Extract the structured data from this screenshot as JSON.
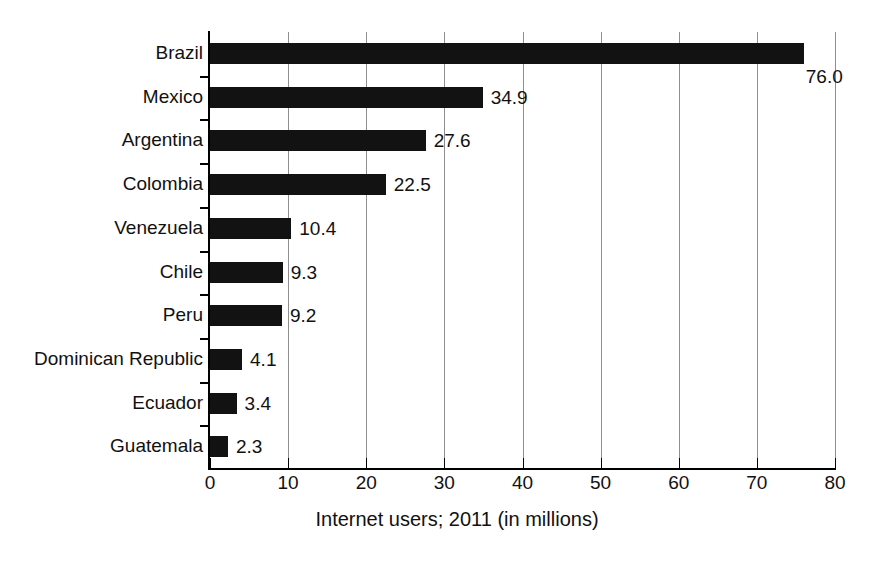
{
  "chart_data": {
    "type": "bar",
    "orientation": "horizontal",
    "title": "",
    "xlabel": "Internet users; 2011 (in millions)",
    "ylabel": "",
    "xlim": [
      0,
      80
    ],
    "xticks": [
      0,
      10,
      20,
      30,
      40,
      50,
      60,
      70,
      80
    ],
    "xtick_labels": [
      "0",
      "10",
      "20",
      "30",
      "40",
      "50",
      "60",
      "70",
      "80"
    ],
    "grid": "vertical",
    "legend": "none",
    "bar_color": "#121212",
    "categories": [
      "Brazil",
      "Mexico",
      "Argentina",
      "Colombia",
      "Venezuela",
      "Chile",
      "Peru",
      "Dominican Republic",
      "Ecuador",
      "Guatemala"
    ],
    "values": [
      76.0,
      34.9,
      27.6,
      22.5,
      10.4,
      9.3,
      9.2,
      4.1,
      3.4,
      2.3
    ],
    "value_labels": [
      "76.0",
      "34.9",
      "27.6",
      "22.5",
      "10.4",
      "9.3",
      "9.2",
      "4.1",
      "3.4",
      "2.3"
    ]
  },
  "colors": {
    "bar": "#121212",
    "grid": "#8e8e8e",
    "axis": "#000000",
    "text": "#111111",
    "background": "#ffffff"
  }
}
